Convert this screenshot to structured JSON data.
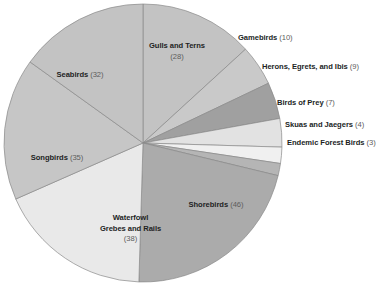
{
  "chart_data": {
    "type": "pie",
    "title": "",
    "subtitle": "",
    "xlabel": "",
    "ylabel": "",
    "legend_position": "none",
    "grid": false,
    "total": 212,
    "categories": [
      "Gulls and Terns",
      "Gamebirds",
      "Herons, Egrets, and Ibis",
      "Birds of Prey",
      "Skuas and Jaegers",
      "Endemic Forest Birds",
      "Shorebirds",
      "Waterfowl Grebes and Rails",
      "Songbirds",
      "Seabirds"
    ],
    "values": [
      28,
      10,
      9,
      7,
      4,
      3,
      46,
      38,
      35,
      32
    ],
    "slices": [
      {
        "name": "Gulls and Terns",
        "label_line1": "Gulls and Terns",
        "label_line2": "(28)",
        "value": 28,
        "count_text": "(28)",
        "color": "#c3c3c3",
        "label_placement": "inside"
      },
      {
        "name": "Gamebirds",
        "label_line1": "Gamebirds",
        "label_line2": "",
        "value": 10,
        "count_text": "(10)",
        "color": "#c9c9c9",
        "label_placement": "outside"
      },
      {
        "name": "Herons, Egrets, and Ibis",
        "label_line1": "Herons, Egrets, and Ibis",
        "label_line2": "",
        "value": 9,
        "count_text": "(9)",
        "color": "#a0a0a0",
        "label_placement": "outside"
      },
      {
        "name": "Birds of Prey",
        "label_line1": "Birds of Prey",
        "label_line2": "",
        "value": 7,
        "count_text": "(7)",
        "color": "#e2e2e2",
        "label_placement": "outside"
      },
      {
        "name": "Skuas and Jaegers",
        "label_line1": "Skuas and Jaegers",
        "label_line2": "",
        "value": 4,
        "count_text": "(4)",
        "color": "#f0f0f0",
        "label_placement": "outside"
      },
      {
        "name": "Endemic Forest Birds",
        "label_line1": "Endemic Forest Birds",
        "label_line2": "",
        "value": 3,
        "count_text": "(3)",
        "color": "#b5b5b5",
        "label_placement": "outside"
      },
      {
        "name": "Shorebirds",
        "label_line1": "Shorebirds",
        "label_line2": "",
        "value": 46,
        "count_text": "(46)",
        "color": "#ababab",
        "label_placement": "inside"
      },
      {
        "name": "Waterfowl Grebes and Rails",
        "label_line1": "Waterfowl",
        "label_line2": "Grebes and Rails",
        "label_line3": "(38)",
        "value": 38,
        "count_text": "(38)",
        "color": "#e9e9e9",
        "label_placement": "inside"
      },
      {
        "name": "Songbirds",
        "label_line1": "Songbirds",
        "label_line2": "",
        "value": 35,
        "count_text": "(35)",
        "color": "#c6c6c6",
        "label_placement": "inside"
      },
      {
        "name": "Seabirds",
        "label_line1": "Seabirds",
        "label_line2": "",
        "value": 32,
        "count_text": "(32)",
        "color": "#c3c3c3",
        "label_placement": "inside"
      }
    ],
    "geometry": {
      "center_x": 143,
      "center_y": 143,
      "radius": 139,
      "start_angle_deg": -90,
      "direction": "clockwise"
    },
    "style": {
      "background": "#ffffff",
      "slice_border": "#8a8a8a",
      "label_color": "#221f1f",
      "count_color": "#5d5d5d"
    }
  },
  "labels": {
    "gulls_name": "Gulls and Terns",
    "gulls_count": "(28)",
    "gamebirds_name": "Gamebirds",
    "gamebirds_count": "(10)",
    "herons_name": "Herons, Egrets, and Ibis",
    "herons_count": "(9)",
    "prey_name": "Birds of Prey",
    "prey_count": "(7)",
    "skuas_name": "Skuas and Jaegers",
    "skuas_count": "(4)",
    "endemic_name": "Endemic Forest Birds",
    "endemic_count": "(3)",
    "shorebirds_name": "Shorebirds",
    "shorebirds_count": "(46)",
    "waterfowl_name": "Waterfowl",
    "waterfowl_name2": "Grebes and Rails",
    "waterfowl_count": "(38)",
    "songbirds_name": "Songbirds",
    "songbirds_count": "(35)",
    "seabirds_name": "Seabirds",
    "seabirds_count": "(32)"
  }
}
